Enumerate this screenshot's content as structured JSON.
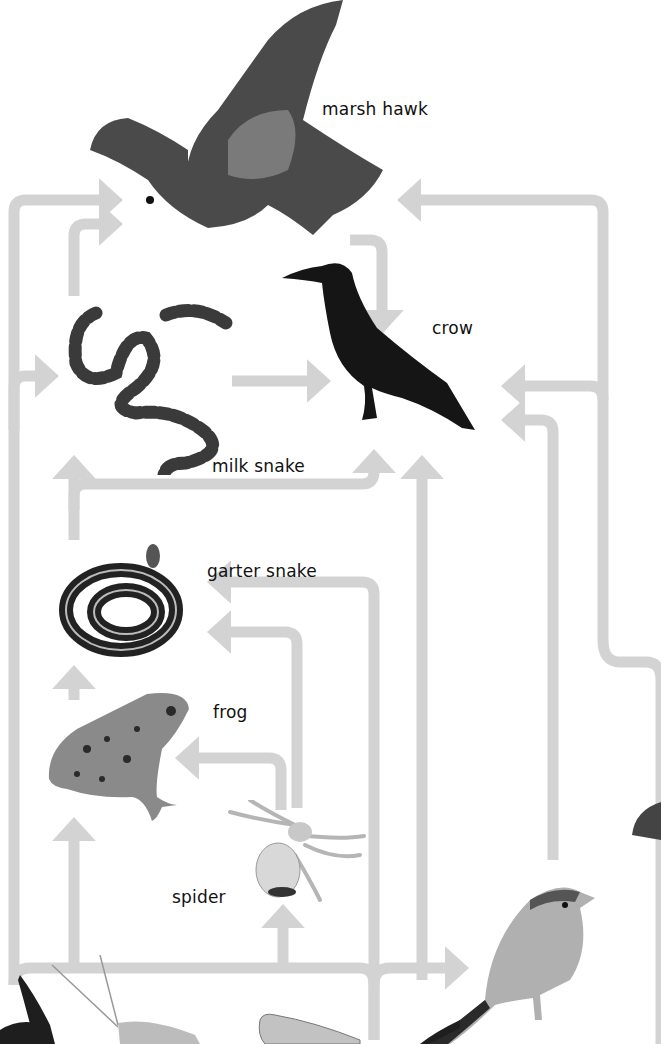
{
  "diagram": {
    "type": "food-web",
    "arrow_color": "#d3d3d3",
    "organisms": [
      {
        "id": "marsh-hawk",
        "label": "marsh hawk"
      },
      {
        "id": "crow",
        "label": "crow"
      },
      {
        "id": "milk-snake",
        "label": "milk snake"
      },
      {
        "id": "garter-snake",
        "label": "garter snake"
      },
      {
        "id": "frog",
        "label": "frog"
      },
      {
        "id": "spider",
        "label": "spider"
      },
      {
        "id": "sparrow",
        "label": ""
      },
      {
        "id": "grasshopper",
        "label": ""
      },
      {
        "id": "caterpillar",
        "label": ""
      }
    ],
    "edges": [
      {
        "from": "milk-snake",
        "to": "marsh-hawk"
      },
      {
        "from": "crow",
        "to": "marsh-hawk"
      },
      {
        "from": "sparrow",
        "to": "marsh-hawk"
      },
      {
        "from": "garter-snake",
        "to": "marsh-hawk"
      },
      {
        "from": "milk-snake",
        "to": "crow"
      },
      {
        "from": "garter-snake",
        "to": "crow"
      },
      {
        "from": "garter-snake",
        "to": "milk-snake"
      },
      {
        "from": "frog",
        "to": "garter-snake"
      },
      {
        "from": "spider",
        "to": "garter-snake"
      },
      {
        "from": "spider",
        "to": "frog"
      },
      {
        "from": "grasshopper",
        "to": "frog"
      },
      {
        "from": "grasshopper",
        "to": "spider"
      },
      {
        "from": "grasshopper",
        "to": "sparrow"
      },
      {
        "from": "caterpillar",
        "to": "crow"
      },
      {
        "from": "sparrow",
        "to": "crow"
      }
    ]
  }
}
